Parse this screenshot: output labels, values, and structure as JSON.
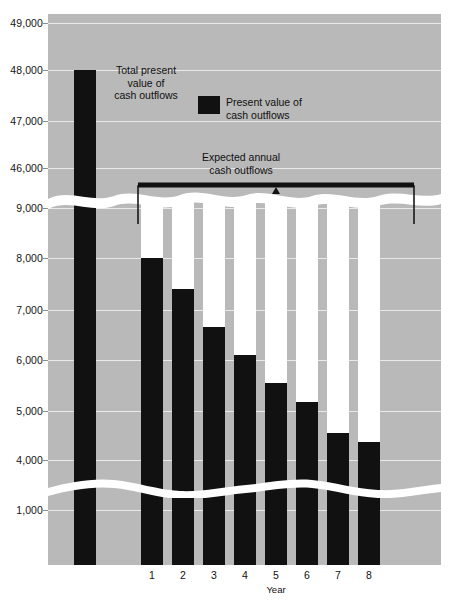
{
  "chart_data": {
    "type": "bar",
    "title": "",
    "xlabel": "Year",
    "ylabel": "",
    "grid": true,
    "axis_note": "Y axis has two scale breaks; upper segment 46,000-49,000 for the total bar, lower segment 1,000-9,000 for annual bars.",
    "ytick_labels": [
      "49,000",
      "48,000",
      "47,000",
      "46,000",
      "9,000",
      "8,000",
      "7,000",
      "6,000",
      "5,000",
      "4,000",
      "1,000"
    ],
    "categories": [
      "1",
      "2",
      "3",
      "4",
      "5",
      "6",
      "7",
      "8"
    ],
    "series": [
      {
        "name": "Expected annual cash outflows",
        "color": "#ffffff",
        "values": [
          10000,
          10000,
          10000,
          10000,
          10000,
          10000,
          10000,
          10000
        ],
        "note": "All eight white bars rise to the same height at the top of the lower axis segment"
      },
      {
        "name": "Present value of cash outflows",
        "color": "#111111",
        "values": [
          8000,
          7380,
          6640,
          6080,
          5530,
          5140,
          4530,
          4360
        ]
      }
    ],
    "total_bar": {
      "label": "Total present value of cash outflows",
      "value": 48000,
      "color": "#111111"
    },
    "annotations": [
      {
        "name": "total-present-value",
        "text": "Total present\nvalue of\ncash outflows"
      },
      {
        "name": "expected-annual",
        "text": "Expected annual\ncash outflows"
      }
    ],
    "legend": {
      "position": "inside-top-right",
      "entries": [
        {
          "label": "Present value of\ncash outflows",
          "color": "#111111"
        }
      ]
    },
    "colors": {
      "plot_background": "#b9b9b9",
      "gridline": "#e9e9e9",
      "bar_dark": "#111111",
      "bar_light": "#ffffff",
      "break_wave": "#ffffff",
      "text": "#101010"
    }
  },
  "axis": {
    "y_labels": [
      {
        "text": "49,000",
        "y": 23
      },
      {
        "text": "48,000",
        "y": 70
      },
      {
        "text": "47,000",
        "y": 121
      },
      {
        "text": "46,000",
        "y": 168
      },
      {
        "text": "9,000",
        "y": 208
      },
      {
        "text": "8,000",
        "y": 258
      },
      {
        "text": "7,000",
        "y": 310
      },
      {
        "text": "6,000",
        "y": 360
      },
      {
        "text": "5,000",
        "y": 411
      },
      {
        "text": "4,000",
        "y": 460
      },
      {
        "text": "1,000",
        "y": 510
      }
    ],
    "x_labels": [
      "1",
      "2",
      "3",
      "4",
      "5",
      "6",
      "7",
      "8"
    ],
    "x_title": "Year"
  },
  "annotations": {
    "total_label": "Total present\nvalue of\ncash outflows",
    "expected_label": "Expected annual\ncash outflows",
    "legend_label": "Present value of\ncash outflows"
  }
}
